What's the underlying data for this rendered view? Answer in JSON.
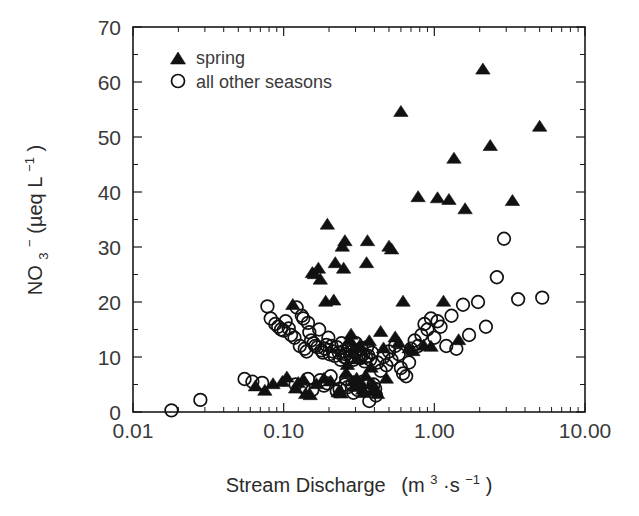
{
  "chart_data": {
    "type": "scatter",
    "title": "",
    "xlabel": "Stream Discharge  (m3·s-1)",
    "xlabel_parts": {
      "main": "Stream Discharge",
      "unit_open": "(m",
      "unit_exp1": "3",
      "unit_mid": "·s",
      "unit_exp2": "−1",
      "unit_close": ")"
    },
    "ylabel": "NO3- (µeq L-1)",
    "ylabel_parts": {
      "species": "NO",
      "sub": "3",
      "charge": "−",
      "unit_open": "  (µeq L",
      "unit_exp": "−1",
      "unit_close": ")"
    },
    "xscale": "log",
    "yscale": "linear",
    "xlim": [
      0.01,
      10.0
    ],
    "ylim": [
      0,
      70
    ],
    "xticks": [
      0.01,
      0.1,
      1.0,
      10.0
    ],
    "xticklabels": [
      "0.01",
      "0.10",
      "1.00",
      "10.00"
    ],
    "yticks": [
      0,
      10,
      20,
      30,
      40,
      50,
      60,
      70
    ],
    "yticklabels": [
      "0",
      "10",
      "20",
      "30",
      "40",
      "50",
      "60",
      "70"
    ],
    "grid": false,
    "ticks_direction": "in",
    "frame": "box",
    "legend": {
      "position": "upper-left-inside",
      "entries": [
        {
          "label": "spring",
          "marker": "filled-triangle",
          "color": "#111111"
        },
        {
          "label": "all other seasons",
          "marker": "open-circle",
          "color": "#111111"
        }
      ]
    },
    "series": [
      {
        "name": "spring",
        "marker": "filled-triangle",
        "color": "#111111",
        "points": [
          [
            0.065,
            4.6
          ],
          [
            0.075,
            3.8
          ],
          [
            0.085,
            5.0
          ],
          [
            0.098,
            5.4
          ],
          [
            0.105,
            6.2
          ],
          [
            0.115,
            19.4
          ],
          [
            0.12,
            4.2
          ],
          [
            0.125,
            5.2
          ],
          [
            0.135,
            5.8
          ],
          [
            0.14,
            3.2
          ],
          [
            0.15,
            3.0
          ],
          [
            0.155,
            25.2
          ],
          [
            0.16,
            25.0
          ],
          [
            0.165,
            5.0
          ],
          [
            0.17,
            26.0
          ],
          [
            0.175,
            24.0
          ],
          [
            0.185,
            6.0
          ],
          [
            0.19,
            20.0
          ],
          [
            0.195,
            34.0
          ],
          [
            0.205,
            5.5
          ],
          [
            0.215,
            20.2
          ],
          [
            0.22,
            27.0
          ],
          [
            0.23,
            3.5
          ],
          [
            0.24,
            3.3
          ],
          [
            0.245,
            30.0
          ],
          [
            0.25,
            26.0
          ],
          [
            0.255,
            31.0
          ],
          [
            0.26,
            7.0
          ],
          [
            0.265,
            8.5
          ],
          [
            0.275,
            13.0
          ],
          [
            0.28,
            14.0
          ],
          [
            0.29,
            5.5
          ],
          [
            0.3,
            4.5
          ],
          [
            0.305,
            6.0
          ],
          [
            0.31,
            9.5
          ],
          [
            0.32,
            12.0
          ],
          [
            0.33,
            5.0
          ],
          [
            0.335,
            4.0
          ],
          [
            0.34,
            3.4
          ],
          [
            0.35,
            6.5
          ],
          [
            0.355,
            27.0
          ],
          [
            0.36,
            31.0
          ],
          [
            0.37,
            12.8
          ],
          [
            0.38,
            8.0
          ],
          [
            0.39,
            5.0
          ],
          [
            0.4,
            4.0
          ],
          [
            0.42,
            3.2
          ],
          [
            0.44,
            14.5
          ],
          [
            0.46,
            11.5
          ],
          [
            0.48,
            6.0
          ],
          [
            0.5,
            30.0
          ],
          [
            0.52,
            29.5
          ],
          [
            0.55,
            13.5
          ],
          [
            0.58,
            12.5
          ],
          [
            0.6,
            54.5
          ],
          [
            0.62,
            20.0
          ],
          [
            0.68,
            11.5
          ],
          [
            0.72,
            11.0
          ],
          [
            0.78,
            39.0
          ],
          [
            0.85,
            12.0
          ],
          [
            0.95,
            11.8
          ],
          [
            1.05,
            38.8
          ],
          [
            1.15,
            20.0
          ],
          [
            1.25,
            38.5
          ],
          [
            1.35,
            46.0
          ],
          [
            1.45,
            13.0
          ],
          [
            1.6,
            36.8
          ],
          [
            2.1,
            62.2
          ],
          [
            2.35,
            48.3
          ],
          [
            3.3,
            38.3
          ],
          [
            5.0,
            51.8
          ]
        ]
      },
      {
        "name": "all other seasons",
        "marker": "open-circle",
        "color": "#111111",
        "points": [
          [
            0.018,
            0.3
          ],
          [
            0.028,
            2.2
          ],
          [
            0.055,
            6.0
          ],
          [
            0.062,
            5.5
          ],
          [
            0.072,
            5.3
          ],
          [
            0.078,
            19.2
          ],
          [
            0.082,
            17.0
          ],
          [
            0.088,
            16.0
          ],
          [
            0.092,
            15.5
          ],
          [
            0.096,
            15.0
          ],
          [
            0.1,
            14.8
          ],
          [
            0.103,
            16.5
          ],
          [
            0.108,
            15.2
          ],
          [
            0.112,
            14.0
          ],
          [
            0.118,
            13.5
          ],
          [
            0.122,
            19.0
          ],
          [
            0.128,
            12.0
          ],
          [
            0.132,
            17.5
          ],
          [
            0.138,
            11.5
          ],
          [
            0.142,
            11.0
          ],
          [
            0.148,
            14.5
          ],
          [
            0.152,
            13.0
          ],
          [
            0.158,
            12.5
          ],
          [
            0.162,
            12.0
          ],
          [
            0.168,
            11.8
          ],
          [
            0.172,
            15.0
          ],
          [
            0.178,
            11.2
          ],
          [
            0.182,
            10.8
          ],
          [
            0.188,
            11.5
          ],
          [
            0.192,
            12.2
          ],
          [
            0.198,
            13.5
          ],
          [
            0.202,
            10.5
          ],
          [
            0.208,
            12.0
          ],
          [
            0.212,
            11.0
          ],
          [
            0.218,
            10.2
          ],
          [
            0.225,
            11.8
          ],
          [
            0.232,
            10.8
          ],
          [
            0.238,
            9.5
          ],
          [
            0.242,
            12.5
          ],
          [
            0.248,
            11.0
          ],
          [
            0.252,
            10.0
          ],
          [
            0.258,
            10.5
          ],
          [
            0.262,
            9.8
          ],
          [
            0.268,
            11.5
          ],
          [
            0.272,
            12.0
          ],
          [
            0.278,
            10.2
          ],
          [
            0.285,
            11.0
          ],
          [
            0.292,
            9.5
          ],
          [
            0.298,
            10.8
          ],
          [
            0.302,
            12.5
          ],
          [
            0.308,
            11.2
          ],
          [
            0.315,
            10.0
          ],
          [
            0.322,
            9.8
          ],
          [
            0.328,
            11.5
          ],
          [
            0.338,
            10.5
          ],
          [
            0.345,
            9.2
          ],
          [
            0.352,
            10.0
          ],
          [
            0.358,
            11.8
          ],
          [
            0.365,
            10.2
          ],
          [
            0.375,
            9.5
          ],
          [
            0.385,
            10.8
          ],
          [
            0.395,
            5.0
          ],
          [
            0.405,
            4.2
          ],
          [
            0.41,
            3.0
          ],
          [
            0.175,
            5.8
          ],
          [
            0.185,
            4.8
          ],
          [
            0.195,
            5.2
          ],
          [
            0.205,
            6.5
          ],
          [
            0.12,
            5.0
          ],
          [
            0.135,
            4.5
          ],
          [
            0.145,
            6.0
          ],
          [
            0.155,
            4.0
          ],
          [
            0.225,
            3.8
          ],
          [
            0.235,
            4.2
          ],
          [
            0.255,
            5.0
          ],
          [
            0.265,
            4.5
          ],
          [
            0.29,
            3.5
          ],
          [
            0.31,
            4.0
          ],
          [
            0.335,
            5.5
          ],
          [
            0.355,
            4.8
          ],
          [
            0.37,
            2.0
          ],
          [
            0.42,
            9.0
          ],
          [
            0.44,
            7.5
          ],
          [
            0.46,
            10.0
          ],
          [
            0.48,
            8.5
          ],
          [
            0.5,
            11.0
          ],
          [
            0.52,
            9.5
          ],
          [
            0.55,
            12.0
          ],
          [
            0.58,
            10.5
          ],
          [
            0.6,
            8.0
          ],
          [
            0.62,
            7.0
          ],
          [
            0.65,
            6.5
          ],
          [
            0.68,
            9.0
          ],
          [
            0.7,
            11.5
          ],
          [
            0.74,
            13.0
          ],
          [
            0.78,
            12.0
          ],
          [
            0.82,
            14.0
          ],
          [
            0.86,
            16.0
          ],
          [
            0.9,
            15.0
          ],
          [
            0.95,
            17.0
          ],
          [
            1.0,
            13.5
          ],
          [
            1.05,
            16.5
          ],
          [
            1.1,
            15.5
          ],
          [
            1.2,
            12.0
          ],
          [
            1.3,
            17.5
          ],
          [
            1.4,
            11.5
          ],
          [
            1.55,
            19.5
          ],
          [
            1.7,
            14.0
          ],
          [
            1.95,
            20.0
          ],
          [
            2.2,
            15.5
          ],
          [
            2.6,
            24.5
          ],
          [
            2.9,
            31.5
          ],
          [
            3.6,
            20.5
          ],
          [
            5.2,
            20.8
          ],
          [
            0.135,
            17.0
          ],
          [
            0.145,
            16.2
          ],
          [
            0.26,
            6.0
          ],
          [
            0.285,
            5.0
          ]
        ]
      }
    ]
  },
  "axes_geometry": {
    "left_px": 133,
    "right_px": 585,
    "top_px": 27,
    "bottom_px": 412
  }
}
